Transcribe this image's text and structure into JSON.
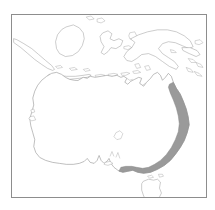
{
  "figure": {
    "type": "distribution-map",
    "region_name": "Australasia",
    "projection_extent": {
      "west_longitude": 94,
      "east_longitude": 168,
      "north_latitude": -2,
      "south_latitude": -46
    },
    "frame": {
      "border_color": "#8d8d8d",
      "background_color": "#ffffff"
    },
    "styles": {
      "coastline_color": "#8a8a8a",
      "island_outline_color": "#9a9a9a",
      "range_fill_color": "#9a9a9a",
      "range_outline_color": "#878787"
    }
  },
  "landmasses": [
    {
      "id": "australia",
      "label": "Australia",
      "shaded": true
    },
    {
      "id": "tasmania",
      "label": "Tasmania",
      "shaded": false
    },
    {
      "id": "new-guinea",
      "label": "New Guinea",
      "shaded": false
    },
    {
      "id": "borneo",
      "label": "Borneo",
      "shaded": false
    },
    {
      "id": "sulawesi",
      "label": "Sulawesi",
      "shaded": false
    },
    {
      "id": "java",
      "label": "Java",
      "shaded": false
    },
    {
      "id": "sumatra",
      "label": "Sumatra",
      "shaded": false
    },
    {
      "id": "lesser-sunda",
      "label": "Lesser Sunda Islands",
      "shaded": false
    },
    {
      "id": "solomon-islands",
      "label": "Solomon Islands",
      "shaded": false
    },
    {
      "id": "new-britain",
      "label": "New Britain",
      "shaded": false
    },
    {
      "id": "kangaroo-island",
      "label": "Kangaroo Island",
      "shaded": false
    }
  ],
  "range": {
    "label": "Shaded distribution range",
    "fill_color": "#9a9a9a",
    "description": "Eastern seaboard band",
    "coverage": [
      "Mid and south-east Queensland coast",
      "New South Wales coast and ranges",
      "Eastern Victoria",
      "Coastal southern Victoria"
    ],
    "north_limit_latitude": -20,
    "south_limit_latitude": -39,
    "includes_tasmania": false
  },
  "inland_features": [
    {
      "id": "lake-eyre",
      "label": "Lake Eyre"
    },
    {
      "id": "spencer-gulf",
      "label": "Spencer Gulf"
    },
    {
      "id": "gulf-st-vincent",
      "label": "Gulf St Vincent"
    },
    {
      "id": "gulf-of-carpentaria",
      "label": "Gulf of Carpentaria"
    },
    {
      "id": "shark-bay",
      "label": "Shark Bay"
    }
  ]
}
